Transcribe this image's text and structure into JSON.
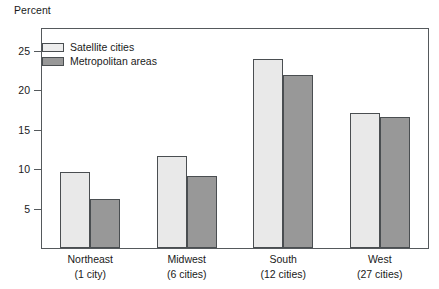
{
  "chart_data": {
    "type": "bar",
    "title": "",
    "ylabel": "Percent",
    "xlabel": "",
    "ylim": [
      0,
      27.8
    ],
    "yticks": [
      5,
      10,
      15,
      20,
      25
    ],
    "grid": false,
    "legend_position": "top-left",
    "categories": [
      "Northeast",
      "Midwest",
      "South",
      "West"
    ],
    "category_sublabels": [
      "(1 city)",
      "(6 cities)",
      "(12 cities)",
      "(27 cities)"
    ],
    "series": [
      {
        "name": "Satellite cities",
        "color": "#e9e9e9",
        "values": [
          9.6,
          11.7,
          24.0,
          17.2
        ]
      },
      {
        "name": "Metropolitan areas",
        "color": "#989898",
        "values": [
          6.2,
          9.1,
          22.0,
          16.6
        ]
      }
    ]
  },
  "axis": {
    "y_caption": "Percent"
  },
  "colors": {
    "light_bar": "#e9e9e9",
    "dark_bar": "#989898",
    "frame": "#55595c",
    "bar_border": "#4a4e51",
    "background": "#ffffff"
  }
}
